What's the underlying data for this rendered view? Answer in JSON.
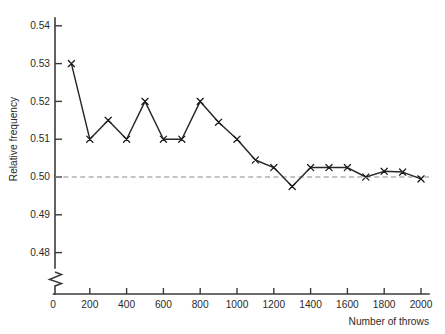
{
  "chart_data": {
    "type": "line",
    "title": "",
    "subtitle": "",
    "xlabel": "Number of throws",
    "ylabel": "Relative frequency",
    "x": [
      100,
      200,
      300,
      400,
      500,
      600,
      700,
      800,
      900,
      1000,
      1100,
      1200,
      1300,
      1400,
      1500,
      1600,
      1700,
      1800,
      1900,
      2000
    ],
    "values": [
      0.53,
      0.51,
      0.515,
      0.51,
      0.52,
      0.51,
      0.51,
      0.52,
      0.5145,
      0.51,
      0.5045,
      0.5025,
      0.4975,
      0.5025,
      0.5025,
      0.5025,
      0.5,
      0.5015,
      0.5013,
      0.4995
    ],
    "series": [
      {
        "name": "Relative frequency of heads",
        "values": [
          0.53,
          0.51,
          0.515,
          0.51,
          0.52,
          0.51,
          0.51,
          0.52,
          0.5145,
          0.51,
          0.5045,
          0.5025,
          0.4975,
          0.5025,
          0.5025,
          0.5025,
          0.5,
          0.5015,
          0.5013,
          0.4995
        ]
      }
    ],
    "xlim": [
      0,
      2000
    ],
    "ylim": [
      0.475,
      0.545
    ],
    "xticks": [
      0,
      200,
      400,
      600,
      800,
      1000,
      1200,
      1400,
      1600,
      1800,
      2000
    ],
    "xtick_labels": [
      "0",
      "200",
      "400",
      "600",
      "800",
      "1000",
      "1200",
      "1400",
      "1600",
      "1800",
      "2000"
    ],
    "yticks": [
      0.48,
      0.49,
      0.5,
      0.51,
      0.52,
      0.53,
      0.54
    ],
    "ytick_labels": [
      "0.48",
      "0.49",
      "0.50",
      "0.51",
      "0.52",
      "0.53",
      "0.54"
    ],
    "grid": false,
    "legend": "none",
    "marker": "x",
    "reference_line": {
      "axis": "y",
      "value": 0.5,
      "style": "dashed",
      "color": "#8a8a8a"
    },
    "axis_break": {
      "axis": "y",
      "present": true,
      "note": "zig-zag break below 0.48"
    },
    "colors": {
      "line": "#272727",
      "marker": "#1a1a1a",
      "axis": "#3b3b3b",
      "reference": "#8a8a8a",
      "text": "#2b2b2b",
      "background": "#ffffff"
    }
  }
}
